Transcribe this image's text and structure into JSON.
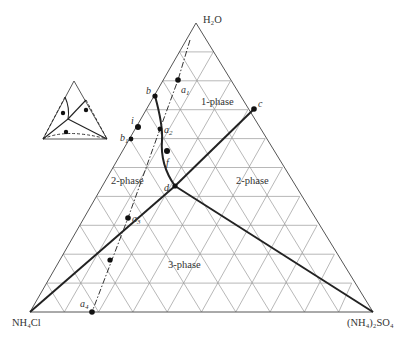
{
  "diagram": {
    "type": "ternary-phase-diagram",
    "vertices": {
      "top": {
        "label": "H2O",
        "display": "H₂O"
      },
      "bottom_left": {
        "label": "NH4Cl",
        "display": "NH₄Cl"
      },
      "bottom_right": {
        "label": "(NH4)2SO4",
        "display": "(NH₄)₂SO₄"
      }
    },
    "grid_divisions": 10,
    "region_labels": [
      {
        "id": "one-phase",
        "text": "1-phase"
      },
      {
        "id": "two-phase-left",
        "text": "2-phase"
      },
      {
        "id": "two-phase-right",
        "text": "2-phase"
      },
      {
        "id": "three-phase",
        "text": "3-phase"
      }
    ],
    "point_labels": {
      "a1": {
        "letter": "a",
        "sub": "1"
      },
      "a2": {
        "letter": "a",
        "sub": "2"
      },
      "a3": {
        "letter": "a",
        "sub": "3"
      },
      "a4": {
        "letter": "a",
        "sub": "4"
      },
      "b": {
        "letter": "b",
        "sub": ""
      },
      "b1": {
        "letter": "b",
        "sub": "1"
      },
      "c": {
        "letter": "c",
        "sub": ""
      },
      "d": {
        "letter": "d",
        "sub": ""
      },
      "f": {
        "letter": "f",
        "sub": ""
      },
      "i": {
        "letter": "i",
        "sub": ""
      }
    },
    "inset": {
      "description": "small schematic triangle showing phase boundaries and tie-lines"
    }
  }
}
